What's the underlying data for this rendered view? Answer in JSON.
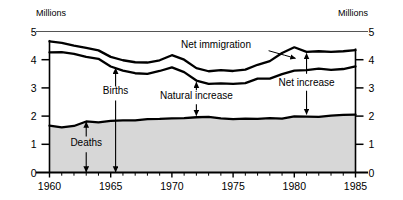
{
  "chart_data": {
    "type": "area",
    "title": "",
    "xlabel": "",
    "ylabel": "Millions",
    "ylabel_right": "Millions",
    "xlim": [
      1960,
      1985
    ],
    "ylim": [
      0,
      5
    ],
    "grid": false,
    "legend_position": "inline-annotations",
    "x_ticks": [
      "1960",
      "1965",
      "1970",
      "1975",
      "1980",
      "1985"
    ],
    "x_tick_values": [
      1960,
      1965,
      1970,
      1975,
      1980,
      1985
    ],
    "x_minor_tick_step": 1,
    "y_ticks": [
      "0",
      "1",
      "2",
      "3",
      "4",
      "5"
    ],
    "y_tick_values": [
      0,
      1,
      2,
      3,
      4,
      5
    ],
    "x": [
      1960,
      1961,
      1962,
      1963,
      1964,
      1965,
      1966,
      1967,
      1968,
      1969,
      1970,
      1971,
      1972,
      1973,
      1974,
      1975,
      1976,
      1977,
      1978,
      1979,
      1980,
      1981,
      1982,
      1983,
      1984,
      1985
    ],
    "series": [
      {
        "name": "Deaths",
        "fill": "#d7d7d7",
        "values": [
          1.66,
          1.6,
          1.65,
          1.81,
          1.78,
          1.83,
          1.85,
          1.85,
          1.89,
          1.9,
          1.92,
          1.93,
          1.96,
          1.97,
          1.92,
          1.89,
          1.91,
          1.9,
          1.93,
          1.91,
          1.99,
          1.98,
          1.97,
          2.02,
          2.04,
          2.05
        ]
      },
      {
        "name": "Births",
        "fill": "none",
        "values": [
          4.26,
          4.27,
          4.21,
          4.1,
          4.03,
          3.76,
          3.61,
          3.52,
          3.5,
          3.6,
          3.73,
          3.56,
          3.26,
          3.14,
          3.16,
          3.14,
          3.17,
          3.33,
          3.33,
          3.49,
          3.61,
          3.63,
          3.68,
          3.64,
          3.67,
          3.76
        ]
      },
      {
        "name": "Births plus net immigration",
        "fill": "none",
        "values": [
          4.65,
          4.6,
          4.5,
          4.42,
          4.33,
          4.1,
          3.98,
          3.91,
          3.9,
          3.98,
          4.16,
          4.0,
          3.7,
          3.59,
          3.63,
          3.6,
          3.65,
          3.82,
          3.95,
          4.24,
          4.44,
          4.28,
          4.3,
          4.28,
          4.3,
          4.34
        ]
      }
    ],
    "annotations": [
      {
        "label": "Net immigration",
        "kind": "leader",
        "x": 1980
      },
      {
        "label": "Natural increase",
        "kind": "double-arrow",
        "x": 1972
      },
      {
        "label": "Net increase",
        "kind": "double-arrow",
        "x": 1981
      },
      {
        "label": "Births",
        "kind": "single-arrow",
        "x": 1965
      },
      {
        "label": "Deaths",
        "kind": "double-arrow",
        "x": 1963
      }
    ]
  },
  "labels": {
    "y_axis_left_title": "Millions",
    "y_axis_right_title": "Millions",
    "net_immigration": "Net immigration",
    "natural_increase": "Natural increase",
    "net_increase": "Net increase",
    "births": "Births",
    "deaths": "Deaths"
  },
  "y_tick_labels_left": [
    "5",
    "4",
    "3",
    "2",
    "1",
    "0"
  ],
  "y_tick_labels_right": [
    "5",
    "4",
    "3",
    "2",
    "1",
    "0"
  ],
  "x_tick_labels": [
    "1960",
    "1965",
    "1970",
    "1975",
    "1980",
    "1985"
  ],
  "colors": {
    "line": "#000000",
    "area_fill": "#d7d7d7",
    "background": "#ffffff",
    "axis": "#000000"
  }
}
